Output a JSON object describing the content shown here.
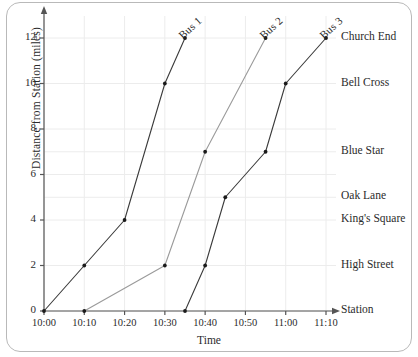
{
  "chart_data": {
    "type": "line",
    "title": "",
    "xlabel": "Time",
    "ylabel": "Distance from Station (miles)",
    "x_tick_labels": [
      "10:00",
      "10:10",
      "10:20",
      "10:30",
      "10:40",
      "10:50",
      "11:00",
      "11:10"
    ],
    "x_tick_minutes": [
      0,
      10,
      20,
      30,
      40,
      50,
      60,
      70
    ],
    "y_tick_labels": [
      "0",
      "2",
      "4",
      "6",
      "8",
      "10",
      "12"
    ],
    "y_tick_values": [
      0,
      2,
      4,
      6,
      8,
      10,
      12
    ],
    "xlim_minutes": [
      0,
      75
    ],
    "ylim": [
      0,
      13
    ],
    "grid": true,
    "legend_position": "inline-end-of-line",
    "stop_labels": [
      {
        "name": "Church End",
        "distance": 12
      },
      {
        "name": "Bell Cross",
        "distance": 10
      },
      {
        "name": "Blue Star",
        "distance": 7
      },
      {
        "name": "Oak Lane",
        "distance": 5
      },
      {
        "name": "King's Square",
        "distance": 4
      },
      {
        "name": "High Street",
        "distance": 2
      },
      {
        "name": "Station",
        "distance": 0
      }
    ],
    "series": [
      {
        "name": "Bus 1",
        "color": "#3a3a3a",
        "points": [
          {
            "time": "10:00",
            "minutes": 0,
            "distance": 0
          },
          {
            "time": "10:10",
            "minutes": 10,
            "distance": 2
          },
          {
            "time": "10:20",
            "minutes": 20,
            "distance": 4
          },
          {
            "time": "10:30",
            "minutes": 30,
            "distance": 10
          },
          {
            "time": "10:35",
            "minutes": 35,
            "distance": 12
          }
        ]
      },
      {
        "name": "Bus 2",
        "color": "#9a9a9a",
        "points": [
          {
            "time": "10:10",
            "minutes": 10,
            "distance": 0
          },
          {
            "time": "10:30",
            "minutes": 30,
            "distance": 2
          },
          {
            "time": "10:40",
            "minutes": 40,
            "distance": 7
          },
          {
            "time": "10:55",
            "minutes": 55,
            "distance": 12
          }
        ]
      },
      {
        "name": "Bus 3",
        "color": "#3a3a3a",
        "points": [
          {
            "time": "10:35",
            "minutes": 35,
            "distance": 0
          },
          {
            "time": "10:40",
            "minutes": 40,
            "distance": 2
          },
          {
            "time": "10:45",
            "minutes": 45,
            "distance": 5
          },
          {
            "time": "10:55",
            "minutes": 55,
            "distance": 7
          },
          {
            "time": "11:00",
            "minutes": 60,
            "distance": 10
          },
          {
            "time": "11:10",
            "minutes": 70,
            "distance": 12
          }
        ]
      }
    ]
  },
  "style": {
    "axis_color": "#555555",
    "grid_color": "#ececec",
    "text_color": "#2b2b2b",
    "frame_color": "#b9b9b9"
  }
}
